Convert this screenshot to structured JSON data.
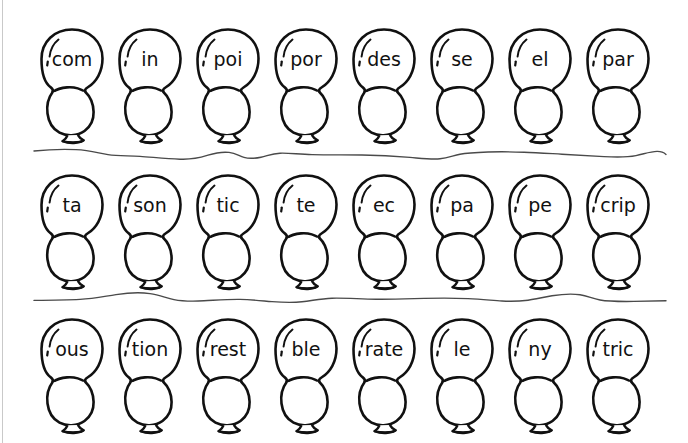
{
  "page": {
    "width": 688,
    "height": 443,
    "background_color": "#ffffff",
    "ink_color": "#111111",
    "edge_rule_color": "#c9c9c9"
  },
  "rows": [
    {
      "name": "row-1",
      "balloons": [
        {
          "label": "com"
        },
        {
          "label": "in"
        },
        {
          "label": "poi"
        },
        {
          "label": "por"
        },
        {
          "label": "des"
        },
        {
          "label": "se"
        },
        {
          "label": "el"
        },
        {
          "label": "par"
        }
      ]
    },
    {
      "name": "row-2",
      "balloons": [
        {
          "label": "ta"
        },
        {
          "label": "son"
        },
        {
          "label": "tic"
        },
        {
          "label": "te"
        },
        {
          "label": "ec"
        },
        {
          "label": "pa"
        },
        {
          "label": "pe"
        },
        {
          "label": "crip"
        }
      ]
    },
    {
      "name": "row-3",
      "balloons": [
        {
          "label": "ous"
        },
        {
          "label": "tion"
        },
        {
          "label": "rest"
        },
        {
          "label": "ble"
        },
        {
          "label": "rate"
        },
        {
          "label": "le"
        },
        {
          "label": "ny"
        },
        {
          "label": "tric"
        }
      ]
    }
  ],
  "dividers": [
    {
      "name": "cut-line-1"
    },
    {
      "name": "cut-line-2"
    }
  ],
  "layout": {
    "first_balloon_x": 36,
    "balloon_spacing": 78,
    "row_tops": [
      26,
      172,
      316
    ],
    "divider_tops": [
      142,
      287
    ],
    "divider_start_x": 34,
    "divider_end_x": 666
  }
}
